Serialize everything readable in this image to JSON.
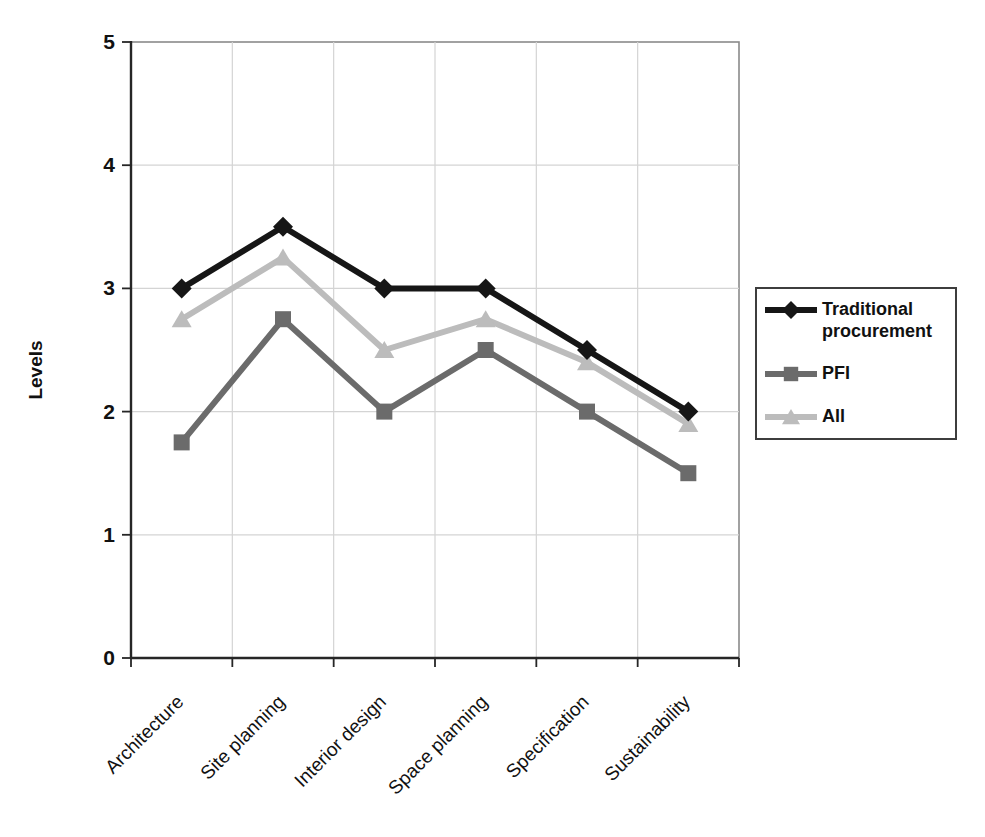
{
  "chart_data": {
    "type": "line",
    "categories": [
      "Architecture",
      "Site planning",
      "Interior design",
      "Space planning",
      "Specification",
      "Sustainability"
    ],
    "series": [
      {
        "name": "Traditional procurement",
        "marker": "diamond",
        "color": "#161616",
        "values": [
          3.0,
          3.5,
          3.0,
          3.0,
          2.5,
          2.0
        ]
      },
      {
        "name": "PFI",
        "marker": "square",
        "color": "#6b6b6b",
        "values": [
          1.75,
          2.75,
          2.0,
          2.5,
          2.0,
          1.5
        ]
      },
      {
        "name": "All",
        "marker": "triangle",
        "color": "#bcbcbc",
        "values": [
          2.75,
          3.25,
          2.5,
          2.75,
          2.4,
          1.9
        ]
      }
    ],
    "title": "",
    "xlabel": "",
    "ylabel": "Levels",
    "ylim": [
      0,
      5
    ],
    "yticks": [
      0,
      1,
      2,
      3,
      4,
      5
    ],
    "grid": true,
    "legend_position": "right"
  },
  "colors": {
    "background": "#ffffff",
    "gridline": "#d4d4d4",
    "plot_border": "#8a8a8a",
    "axis": "#262626",
    "tick_label": "#111111",
    "legend_border": "#3d3d3d"
  }
}
